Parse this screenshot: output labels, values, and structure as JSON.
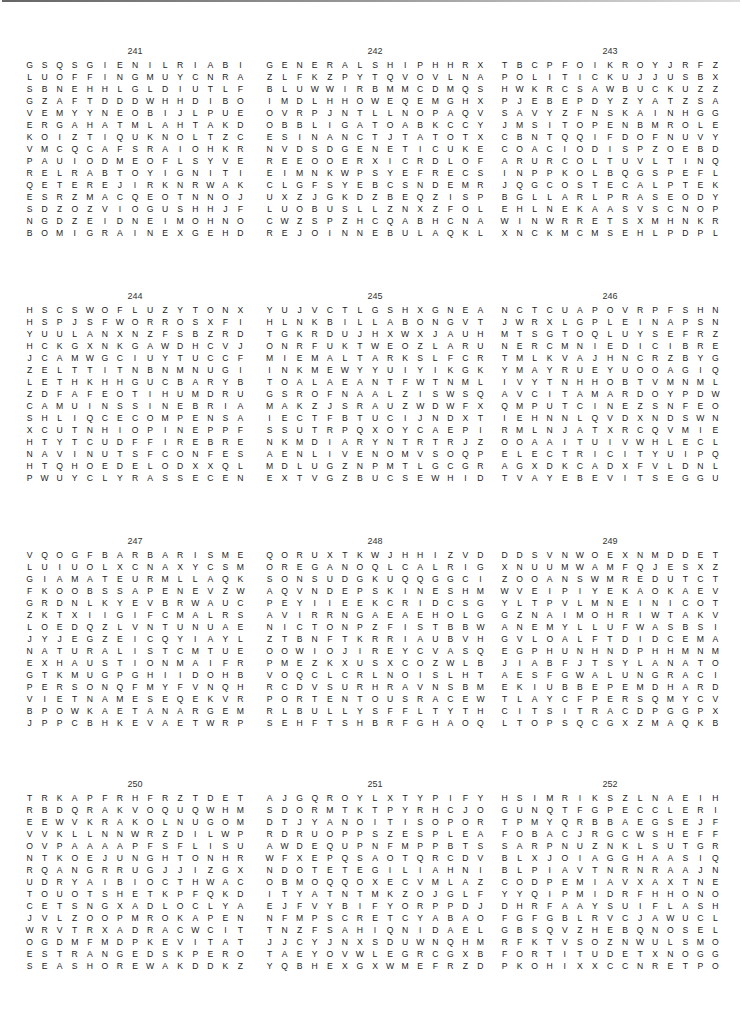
{
  "puzzles": [
    {
      "number": "241",
      "rows": [
        "GSQSGIENILRIABIKZDSN",
        "LUOFFINGMUYCNRADIZQG",
        "SBNEHHLGLDIUTLFSLAQI",
        "GZAFTDDDWHHDIBOAISMG",
        "VEMYYNEOBIJLPUEVBNXB",
        "ERGAHATMLAHTAKDNUXCO",
        "KOIZTIQUKNOLTZCZINHY",
        "VMCQCAFSRAIOHKRGCSNZ",
        "PAUIODMEOFLSYVENALOV",
        "RELRABTOYIGNITIONLIN",
        "QETEREJIRKNRWAKENYTZ",
        "ESRZMACQEOTNNOJFVMIK",
        "SDZOZVIOGUSHHJFMEYBM",
        "NGDZEIDNEIMOHNOBUWMA",
        "BOMIGRAINEXGEHDUVPAE"
      ],
      "found_words": [
        "ENILRIA",
        "OFFING",
        "IGNITION",
        "WAKEN",
        "VENAL",
        "EIMOHNOB",
        "MIGRAINE"
      ]
    },
    {
      "number": "242",
      "rows": [
        "GENERALSHIPHHRXXSLCZ",
        "ZLFKZPYTQVOVLNAOUAOF",
        "BLUWWIRBMMCDMQSGCCCS",
        "IMDLHHOWEQEMGHXFKQKS",
        "OVRPJNTLLNOPAQVWLULK",
        "OBBLIGATOABKCCYNIIEY",
        "ESINANCTJTATOTXLNSSW",
        "NVDSDGENETICUKEFGIHR",
        "REEOOERXICRDLOFOWTEI",
        "EIMNKWPSYEFRECSRHILT",
        "CLGFSYEBCSNDEMRKNOLI",
        "UXZJGKDZBEQZISPNQNRN",
        "LUOBUSLLZNXZFOLRTFQG",
        "CWZSPZHCQABHCNAWBARI",
        "REJOINNEBULAQKLLSPKW"
      ],
      "found_words": [
        "GENERALSHIP",
        "OBBLIGATO",
        "ESINANC",
        "GENETIC",
        "DLOFOWT",
        "AWBARI",
        "REJOIN",
        "NEBULA"
      ]
    },
    {
      "number": "243",
      "rows": [
        "TBCPFOIKROYJRFZIPOOA",
        "POLITICKUJJUSBXNCCMD",
        "HWKRCSAWBUCKUZZTTLYA",
        "PJEBEPDYZYATZSAEWWPY",
        "SAVYZFNSKAINHGGRWWOF",
        "JMSITOPENBMROLENNREC",
        "CBNTQQIFDOFNUVYEYRTH",
        "COACIODISPZOEBDETHHO",
        "ARURCOLTUVLTINQTIARGL",
        "INPPKOLBQGSPEFLJZIIU",
        "JQGCOSTECALPTEKRAMST",
        "BGLLARLPRASEODYMIUME",
        "EHLNEKAASVSCNOPCXZZC",
        "WINWRRETSXMHNKRTECVA",
        "XNCKMCMSEHLPDPLTJNTZ"
      ],
      "found_words": [
        "POLITICK",
        "SAWBUCK",
        "MSITOPEN",
        "ECALPTEKRAM",
        "PRASEODYMIUM"
      ]
    },
    {
      "number": "244",
      "rows": [
        "HSCSWOFLUZYTONXCMFBS",
        "HSPJSFWORROSXFIXEEOE",
        "YUULANXNZFSBZRDLISKZ",
        "HCKGXNKGAWDHCVJWHTAN",
        "JCAMWGCIUYTUCCFHEIRB",
        "ZELTTITNBNMNUGIHKVOY",
        "LETHKHHGUCBARYBEOAZN",
        "ZDFAFEOTIHUMDRUMULBR",
        "CAMUINSSINEBRIATEDIE",
        "SHLIQCECOMPENSATIONJ",
        "XCUTNHIOPINEPPFCCAPW",
        "HTYTCUDFFIREBREAKBAH",
        "NAVINUTSFCONFESSIONP",
        "HTQHOEDELODXXQLOULWF",
        "PWUYCLYRASSECENFCRZW"
      ],
      "found_words": [
        "WORROS",
        "HUMDRUM",
        "INEBRIATED",
        "COMPENSATION",
        "OPINE",
        "FIREBREAK",
        "CONFESSION",
        "YRASSECEN"
      ]
    },
    {
      "number": "245",
      "rows": [
        "YUJVCTLGSHXGNEAHGNOT",
        "HLNKBILLABONGVTFLSBR",
        "TGKRDUJHXWXJAUHMHAYO",
        "ONRFUKTWEOZLARUTLUCO",
        "MIEMALTARKSLFCRTCJXM",
        "INKMEWYYUIYIKGKJIINE",
        "TOALAEANTFWTNMLBNVQT",
        "GSROFNAALZISWSQEOMAT",
        "MAKZJSRAUZWDWFXRHOKE",
        "IECTFBTUCIJNDXTFPYTH",
        "SSUTRPQXOYCAEPITOMEC",
        "NKMDIARYNTRTRJZDNAEO",
        "AENLIVENOMVSOQPPOSOI",
        "MDLUGZNPMTLGCGRDMKBR",
        "EXTVGZBUCSEWHIDPJADB"
      ],
      "found_words": [
        "EAHGNOT",
        "BILLABONG",
        "LARUTLUC",
        "MALTAR",
        "EPITOME",
        "DIARY",
        "ENLIVEN"
      ]
    },
    {
      "number": "246",
      "rows": [
        "NCTCUAPOVRPFSHNLAKSA",
        "JWRXLGPLEINAPSNNNTPU",
        "MTSGTOQLUYSEFRZXAREG",
        "NERCMNIEDICIBREHHACU",
        "TMLKVAJHNCRZBYGMEIIR",
        "YMAYRUEYUOOAGIQAILAH",
        "IVYTNHHOBTVMNMLNMWLS",
        "AVCITAMARDOYPDWICBID",
        "QMPUTCINEZSNFEONTBZV",
        "IEHNNLQVDXNDSWNMUYEL",
        "RMLNJATXRCQVMIEDDNOZ",
        "OOAAITUIVWHLECLPIEKZ",
        "ELECTRICITYUIPQAYUGW",
        "AGXDKCADXFVLDNLCGDMP",
        "TVAYEBEVITSEGGUSGUPN"
      ],
      "found_words": [
        "LEINAPS",
        "EDICIBREH",
        "CITAMARD",
        "ELECTRICITY",
        "EVITS",
        "SEGGUS"
      ]
    },
    {
      "number": "247",
      "rows": [
        "VQOGFBARBARISMEAILMA",
        "LUIUOLXCNAXYCSMBMEZO",
        "GIAMATEURMLLAQKAPGSC",
        "FKOOBSSAPENEVZWLAAFE",
        "GRDNLKYEVBRWAUCORLDN",
        "ZKTXIIGIFCMALRSNTILT",
        "LOEDQZLVNTUNUAEEHSYI",
        "JYJEGZEICQYIAYLFKMNM",
        "NATURALISTCMTUELRJOE",
        "EXHAUSTIONMAIFRVEAMX",
        "GTKMUGPGHIIDOHBNTYIE",
        "PERSONQFMYFVNQHNIJRN",
        "VIETNAMESEQEKVRKEYTX",
        "BPOWKAETANARGEMOPJAV",
        "JPPCBHKEVAETWRPMWEML"
      ],
      "found_words": [
        "BARBARISM",
        "AMATEUR",
        "KOOBSSAP",
        "NATURALIST",
        "EXHAUSTION",
        "PERSON",
        "VIETNAMESE",
        "ETANARGEMOP"
      ]
    },
    {
      "number": "248",
      "rows": [
        "QORUXTKWJHHIZVDZCJSH",
        "OREGANOQLCALRIGHTUDO",
        "SONSUDGKUQQGGCIEXSBL",
        "AQVNDEPSKINESHMAREAL",
        "PEYIIEEKCRIDCSGRXVOA",
        "AVIRRNGAEAEHOLGUINSN",
        "NICTONPZFISTBBWSNKAD",
        "ZTBNFTKRRIAUBVHYCQSE",
        "OOWIOJIREYCVASQAYZCP",
        "PMEZKXUSXCOZWLBINYOP",
        "VOQCLCRLNOISLHTFWZSI",
        "RCDVSURHRAVNSBMYSNBL",
        "PORTENTOUSRACEWIEMLS",
        "RLBULLYSFFLTYTHKCVOU",
        "SEHFTSHBRFGHAOQSDJLW"
      ],
      "found_words": [
        "OREGANO",
        "ALRIGHT",
        "KINESHMA",
        "HOLGUIN",
        "PORTENTOUS",
        "BULLY"
      ]
    },
    {
      "number": "249",
      "rows": [
        "DDSVNWOEXNMDDETROSSA",
        "XNUUMWAMFQJESXZWTDDM",
        "ZOOANSWMREDUTCTVMDXK",
        "WVEIPIYEKAOKAEVJGQXE",
        "YLTPVLMNEINICOTTAGEN",
        "GZNAIMOHRIWTAKVHJVUE",
        "ANEMYLLUFWASBSICNCRM",
        "GVLOALFTDIDCEMABGUGA",
        "EGPHUNHNDPHHMNMPBCDQ",
        "JIABFJTSYLANATOFLUNE",
        "AESFGWALUNGRACIOUSTK",
        "EKIUBBEPEMDHARDTACKZ",
        "TLAYCFPERSQMYCVSSPUR",
        "CITSITRACDPGGPXICVBB",
        "LTOPSQCGXZMAQKBHJRCM"
      ],
      "found_words": [
        "DETROSSA",
        "COTTAGE",
        "MYLLUFWA",
        "TSYLANA",
        "UNGRACIOUS",
        "HARDTACK",
        "CITSITRA"
      ]
    },
    {
      "number": "250",
      "rows": [
        "TRKAPFRHFRZTDETESTUO",
        "RBDQRAKVOQUQWHMAYIQI",
        "EEWVKRAKOLNUGOMBFYJV",
        "VVKLLNNWRZDILWPFASXE",
        "OVPAAAAPFSFLISUIETLSR",
        "NTKOEJUNGHTONHRLNTMN",
        "RQANGRRUGJJIZGXEONDA",
        "UDRYAIBIOCTHWACKKBYC",
        "TOUOTSHETKPFQKDSAQEU",
        "CETSNGXADLOCLYAKJWNL",
        "JVLZOOPMROKAPENNONRA",
        "WRVTRXADRACWCITDGFUR",
        "OGDMFMDPKEVITATUPQOK",
        "ESTRANGEDSKPERODOYJU",
        "SEASHOREWAKDDKZYDIAC"
      ],
      "found_words": [
        "DETESTUO",
        "THWACK",
        "PENNON",
        "EVITATUP",
        "ESTRANGED",
        "SEASHORE"
      ]
    },
    {
      "number": "251",
      "rows": [
        "AJGQROYLXTYPIFYEFSFV",
        "SDORMTKTPYRHCJOIHUKR",
        "DTJYANOITISOPORPRSTT",
        "RDRUOPPSZESPLEASEPZR",
        "AWDEQUPNFMPPBTSYDEMI",
        "WFXEPQSAOTQRCDVULNBP",
        "NDOTETEGILIAHNILODOL",
        "OBMOQQOXECVMLAZYMPLE",
        "ITYATNTMKZOJGLFDVAST",
        "EJFVYBIFYORPPDJKJKDE",
        "NFMPSCRETCYABAOLVBPB",
        "TNZFSAHIQNIDAELHLCGW",
        "JJCYJNXSDUWNQHMZBADU",
        "TAEYOVWLEGRCGXBNMHKQ",
        "YQBHEXGXWMEFRZDMRBCY"
      ],
      "found_words": [
        "TYPIFY",
        "NOITISOPORP",
        "PLEASE",
        "AHNIL",
        "QNIDAEL"
      ]
    },
    {
      "number": "252",
      "rows": [
        "HSIMRIKSZLNAEIHAUXWI",
        "GUNQTFGPECCLERICALTN",
        "TPMYQRBBAEGSEJFBJPEW",
        "FOBACJRGCWSHEFFIELDA",
        "SARPNUZNKLSUTGRHLGJR",
        "BLXJOIAGGHAASIQNQEDD",
        "BLPIAVTNRNRAAJNTFYBS",
        "CODPEMIAVXAXTNEEDLER",
        "YYQIPMIDRFHHONORABLE",
        "DHRFAAYSUIFLASHINGIX",
        "FGFGBLRVCJAWUCLOAKOE",
        "GBSQVZHEBQNOSELDARC",
        "RFKTVSOZNWULSMOGBPNA",
        "FORTITUDETXNOGGYDINR",
        "PKOHIXXCCNRETPOCILEH"
      ],
      "found_words": [
        "HSIMRIKS",
        "CLERICAL",
        "SHEFFIELD",
        "NEEDLE",
        "HONORABLE",
        "FLASHING",
        "CLOAK",
        "NOSELDARC",
        "FORTITUDE",
        "RETPOCILEH"
      ]
    }
  ]
}
